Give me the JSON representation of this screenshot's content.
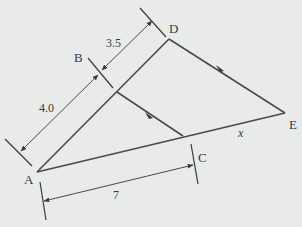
{
  "diagram": {
    "type": "similar-triangles",
    "background_color": "#e9eaea",
    "line_color": "#4a4a4a",
    "points": {
      "A": "A",
      "B": "B",
      "C": "C",
      "D": "D",
      "E": "E"
    },
    "segment_labels": {
      "AB": "4.0",
      "BD": "3.5",
      "AC": "7",
      "CE": "x"
    }
  }
}
